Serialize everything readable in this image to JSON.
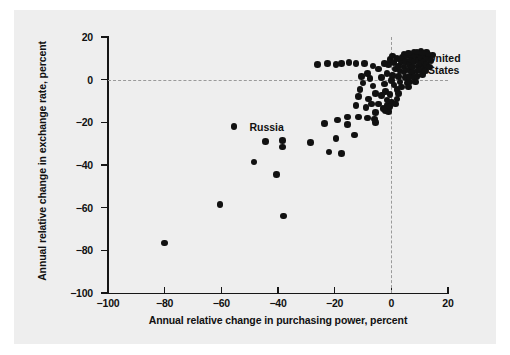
{
  "chart_data": {
    "type": "scatter",
    "title": "",
    "xlabel": "Annual relative change in purchasing power, percent",
    "ylabel": "Annual relative change in exchange rate, percent",
    "xlim": [
      -100,
      20
    ],
    "ylim": [
      -100,
      20
    ],
    "xticks": [
      -100,
      -80,
      -60,
      -40,
      -20,
      0,
      20
    ],
    "xticklabels": [
      "-100",
      "-80",
      "-60",
      "-40",
      "-20",
      "0",
      "20"
    ],
    "yticks": [
      -100,
      -80,
      -60,
      -40,
      -20,
      0,
      20
    ],
    "yticklabels": [
      "-100",
      "-80",
      "-60",
      "-40",
      "-20",
      "0",
      "20"
    ],
    "grid": false,
    "reference_lines": {
      "horizontal": 0,
      "vertical": 0,
      "style": "dashed",
      "color": "#9a9a9a"
    },
    "legend": "none",
    "marker": {
      "shape": "circle",
      "color": "#111111",
      "size": 6.6
    },
    "annotations": [
      {
        "text": "Russia",
        "x": -51.5,
        "y": -22.5,
        "align": "left"
      },
      {
        "text": "United\nStates",
        "x": 11.5,
        "y": 9.5,
        "align": "left"
      }
    ],
    "points": [
      {
        "x": -80.0,
        "y": -76.5
      },
      {
        "x": -60.5,
        "y": -58.5
      },
      {
        "x": -38.0,
        "y": -64.0
      },
      {
        "x": -40.5,
        "y": -44.5
      },
      {
        "x": -48.5,
        "y": -38.5
      },
      {
        "x": -55.5,
        "y": -22.0
      },
      {
        "x": -44.5,
        "y": -29.0
      },
      {
        "x": -38.5,
        "y": -28.5
      },
      {
        "x": -38.5,
        "y": -31.5
      },
      {
        "x": -28.5,
        "y": -29.5
      },
      {
        "x": -22.0,
        "y": -34.0
      },
      {
        "x": -17.5,
        "y": -34.5
      },
      {
        "x": -19.5,
        "y": -27.5
      },
      {
        "x": -13.0,
        "y": -26.0
      },
      {
        "x": -15.5,
        "y": -21.0
      },
      {
        "x": -19.0,
        "y": -19.0
      },
      {
        "x": -15.5,
        "y": -17.5
      },
      {
        "x": -11.5,
        "y": -17.5
      },
      {
        "x": -8.5,
        "y": -18.0
      },
      {
        "x": -6.0,
        "y": -18.5
      },
      {
        "x": -5.5,
        "y": -15.5
      },
      {
        "x": -2.0,
        "y": -14.5
      },
      {
        "x": -1.0,
        "y": -15.0
      },
      {
        "x": -1.5,
        "y": -12.0
      },
      {
        "x": -4.5,
        "y": -11.5
      },
      {
        "x": -9.0,
        "y": -13.0
      },
      {
        "x": -12.5,
        "y": -12.0
      },
      {
        "x": -11.5,
        "y": -8.0
      },
      {
        "x": -11.0,
        "y": -4.5
      },
      {
        "x": -10.0,
        "y": -1.5
      },
      {
        "x": -10.5,
        "y": 1.5
      },
      {
        "x": -8.5,
        "y": 3.0
      },
      {
        "x": -7.5,
        "y": 0.5
      },
      {
        "x": -6.5,
        "y": -3.0
      },
      {
        "x": -5.5,
        "y": -6.5
      },
      {
        "x": -3.5,
        "y": -7.5
      },
      {
        "x": -2.0,
        "y": -5.5
      },
      {
        "x": -0.5,
        "y": -7.0
      },
      {
        "x": -2.5,
        "y": -2.0
      },
      {
        "x": -3.5,
        "y": 1.0
      },
      {
        "x": -1.5,
        "y": 3.0
      },
      {
        "x": -4.5,
        "y": 5.0
      },
      {
        "x": -6.5,
        "y": 6.5
      },
      {
        "x": -9.5,
        "y": 7.5
      },
      {
        "x": -12.5,
        "y": 7.5
      },
      {
        "x": -15.0,
        "y": 8.0
      },
      {
        "x": -17.5,
        "y": 7.5
      },
      {
        "x": -19.5,
        "y": 7.0
      },
      {
        "x": -22.5,
        "y": 7.5
      },
      {
        "x": -26.0,
        "y": 7.0
      },
      {
        "x": -1.0,
        "y": 7.0
      },
      {
        "x": -0.5,
        "y": 9.5
      },
      {
        "x": 0.5,
        "y": 11.0
      },
      {
        "x": 1.0,
        "y": 8.0
      },
      {
        "x": 1.5,
        "y": 5.0
      },
      {
        "x": 0.5,
        "y": 2.0
      },
      {
        "x": 0.0,
        "y": -0.5
      },
      {
        "x": 1.0,
        "y": -2.5
      },
      {
        "x": 2.0,
        "y": -4.5
      },
      {
        "x": 2.5,
        "y": -6.5
      },
      {
        "x": 3.5,
        "y": -3.5
      },
      {
        "x": 3.0,
        "y": -1.0
      },
      {
        "x": 2.5,
        "y": 1.5
      },
      {
        "x": 3.0,
        "y": 4.0
      },
      {
        "x": 2.5,
        "y": 6.5
      },
      {
        "x": 3.5,
        "y": 8.5
      },
      {
        "x": 4.0,
        "y": 10.5
      },
      {
        "x": 4.5,
        "y": 12.0
      },
      {
        "x": 5.5,
        "y": 11.0
      },
      {
        "x": 5.0,
        "y": 8.5
      },
      {
        "x": 4.5,
        "y": 6.0
      },
      {
        "x": 4.5,
        "y": 3.5
      },
      {
        "x": 5.0,
        "y": 1.0
      },
      {
        "x": 5.5,
        "y": -1.5
      },
      {
        "x": 6.0,
        "y": -3.5
      },
      {
        "x": 6.5,
        "y": -1.0
      },
      {
        "x": 6.5,
        "y": 1.5
      },
      {
        "x": 6.0,
        "y": 4.5
      },
      {
        "x": 6.5,
        "y": 7.0
      },
      {
        "x": 7.0,
        "y": 9.5
      },
      {
        "x": 7.5,
        "y": 11.5
      },
      {
        "x": 8.0,
        "y": 13.0
      },
      {
        "x": 8.5,
        "y": 11.0
      },
      {
        "x": 8.0,
        "y": 8.5
      },
      {
        "x": 7.5,
        "y": 6.0
      },
      {
        "x": 7.5,
        "y": 3.5
      },
      {
        "x": 8.0,
        "y": 1.0
      },
      {
        "x": 8.5,
        "y": -1.0
      },
      {
        "x": 9.0,
        "y": 1.5
      },
      {
        "x": 9.0,
        "y": 4.0
      },
      {
        "x": 9.5,
        "y": 6.5
      },
      {
        "x": 9.5,
        "y": 9.0
      },
      {
        "x": 10.0,
        "y": 11.5
      },
      {
        "x": 10.5,
        "y": 13.5
      },
      {
        "x": 10.5,
        "y": 10.5
      },
      {
        "x": 10.5,
        "y": 7.5
      },
      {
        "x": 10.0,
        "y": 4.5
      },
      {
        "x": 11.0,
        "y": 2.5
      },
      {
        "x": 11.5,
        "y": 5.5
      },
      {
        "x": 11.5,
        "y": 8.5
      },
      {
        "x": 12.0,
        "y": 11.0
      },
      {
        "x": 12.5,
        "y": 13.0
      },
      {
        "x": 13.0,
        "y": 10.0
      },
      {
        "x": 12.5,
        "y": 7.0
      },
      {
        "x": 12.0,
        "y": 4.0
      },
      {
        "x": 13.5,
        "y": 6.0
      },
      {
        "x": 14.0,
        "y": 9.0
      },
      {
        "x": 14.5,
        "y": 11.5
      },
      {
        "x": 2.0,
        "y": -9.0
      },
      {
        "x": 0.0,
        "y": -10.5
      },
      {
        "x": -1.5,
        "y": -9.5
      },
      {
        "x": -0.5,
        "y": -12.5
      },
      {
        "x": 1.5,
        "y": -11.5
      },
      {
        "x": -3.0,
        "y": -13.5
      },
      {
        "x": -5.5,
        "y": -20.0
      },
      {
        "x": -23.5,
        "y": -20.5
      },
      {
        "x": -8.0,
        "y": -9.0
      },
      {
        "x": -7.0,
        "y": -11.5
      },
      {
        "x": 9.0,
        "y": 13.0
      },
      {
        "x": 6.0,
        "y": 12.5
      },
      {
        "x": 2.0,
        "y": 10.0
      },
      {
        "x": -2.5,
        "y": 7.5
      },
      {
        "x": 13.0,
        "y": 12.0
      },
      {
        "x": 11.0,
        "y": 12.5
      }
    ]
  }
}
